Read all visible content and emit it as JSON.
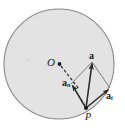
{
  "figure": {
    "background_color": "#ffffff",
    "disk": {
      "name": "circular-path-disk",
      "center_x": 59,
      "center_y": 64,
      "radius": 55,
      "fill_color": "#e3e3e3",
      "stroke_color": "#808080",
      "stroke_width": 1.1
    },
    "points": [
      {
        "id": "O",
        "label": "O",
        "x": 59,
        "y": 64,
        "dot": true,
        "dot_radius": 1.9
      },
      {
        "id": "P",
        "label": "P",
        "x": 86,
        "y": 108,
        "dot": true,
        "dot_radius": 2.0
      }
    ],
    "dashed_line": {
      "name": "radius-dashed-line",
      "x1": 61,
      "y1": 66,
      "x2": 79,
      "y2": 89,
      "stroke_color": "#333333",
      "dash": "3 2"
    },
    "vectors": [
      {
        "id": "a",
        "label": "a",
        "subscript": "",
        "description": "total acceleration vector from P",
        "x1": 86,
        "y1": 108,
        "x2": 92,
        "y2": 62,
        "stroke_color": "#2b2b2b"
      },
      {
        "id": "an",
        "label": "a",
        "subscript": "n",
        "description": "normal (centripetal) acceleration component from P toward O",
        "x1": 86,
        "y1": 108,
        "x2": 71,
        "y2": 84,
        "stroke_color": "#2b2b2b"
      },
      {
        "id": "at",
        "label": "a",
        "subscript": "t",
        "description": "tangential acceleration component from P",
        "x1": 86,
        "y1": 108,
        "x2": 110,
        "y2": 88,
        "stroke_color": "#2b2b2b"
      }
    ],
    "construction_lines": [
      {
        "name": "parallelogram-side-an-to-a",
        "x1": 71,
        "y1": 84,
        "x2": 92,
        "y2": 62,
        "stroke_color": "#6b6b6b"
      },
      {
        "name": "parallelogram-side-at-to-a",
        "x1": 110,
        "y1": 88,
        "x2": 92,
        "y2": 62,
        "stroke_color": "#6b6b6b"
      }
    ],
    "labels": {
      "center_point": "O",
      "particle_point": "P",
      "total_acceleration": "a",
      "normal_acceleration_base": "a",
      "normal_acceleration_sub": "n",
      "tangential_acceleration_base": "a",
      "tangential_acceleration_sub": "t"
    }
  }
}
